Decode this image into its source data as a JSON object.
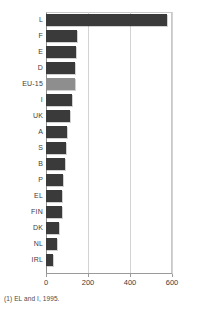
{
  "chart_data": {
    "type": "bar",
    "orientation": "horizontal",
    "title": "",
    "subtitle": "",
    "xlabel": "",
    "ylabel": "",
    "xlim": [
      0,
      600
    ],
    "ylim": null,
    "grid": true,
    "legend": null,
    "xticks": [
      0,
      200,
      400,
      600
    ],
    "xtick_labels": [
      "0",
      "200",
      "400",
      "600"
    ],
    "categories": [
      "L",
      "F",
      "E",
      "D",
      "EU-15",
      "I",
      "UK",
      "A",
      "S",
      "B",
      "P",
      "EL",
      "FIN",
      "DK",
      "NL",
      "IRL"
    ],
    "values": [
      574,
      148,
      143,
      140,
      137,
      124,
      113,
      100,
      95,
      90,
      82,
      78,
      76,
      62,
      50,
      33
    ],
    "highlight_category": "EU-15",
    "colors": {
      "bar": "#3a3a3a",
      "bar_highlight": "#8e8e8e",
      "grid": "#d3d3d3",
      "axis": "#9a9a9a",
      "frame": "#c9c9c9",
      "text": "#3c3c3c"
    },
    "annotations": [
      "(1) EL and I, 1995."
    ]
  },
  "footnote": {
    "text": "(1) EL and I, 1995."
  }
}
